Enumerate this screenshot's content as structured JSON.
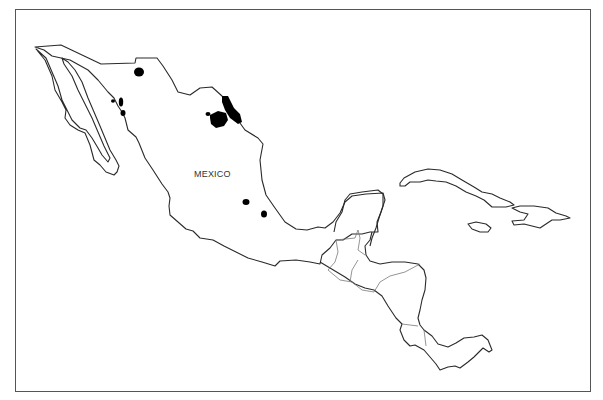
{
  "map": {
    "title": "",
    "labels": {
      "mexico": "MEXICO"
    },
    "colors": {
      "outline": "#2a2a2a",
      "border": "#7a7a7a",
      "marked_regions": "#000000",
      "background": "#ffffff",
      "frame": "#555555"
    },
    "regions_shown": [
      "Mexico",
      "Central America",
      "Cuba",
      "Jamaica",
      "Hispaniola"
    ],
    "marked_areas_count": 9
  }
}
